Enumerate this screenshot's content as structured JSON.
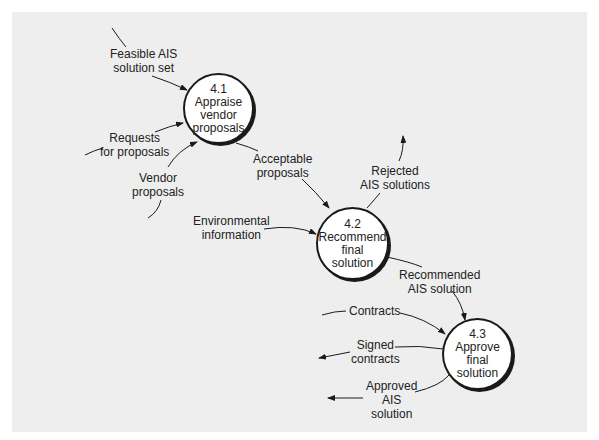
{
  "colors": {
    "panel_bg": "#eeeeee",
    "line": "#1a1a1a",
    "process_fill": "#ffffff"
  },
  "processes": [
    {
      "id": "4.1",
      "lines": [
        "4.1",
        "Appraise",
        "vendor",
        "proposals"
      ]
    },
    {
      "id": "4.2",
      "lines": [
        "4.2",
        "Recommend",
        "final",
        "solution"
      ]
    },
    {
      "id": "4.3",
      "lines": [
        "4.3",
        "Approve",
        "final",
        "solution"
      ]
    }
  ],
  "flows": [
    {
      "name": "feasible-ais-solution-set",
      "lines": [
        "Feasible AIS",
        "solution set"
      ]
    },
    {
      "name": "requests-for-proposals",
      "lines": [
        "Requests",
        "for proposals"
      ]
    },
    {
      "name": "vendor-proposals",
      "lines": [
        "Vendor",
        "proposals"
      ]
    },
    {
      "name": "acceptable-proposals",
      "lines": [
        "Acceptable",
        "proposals"
      ]
    },
    {
      "name": "rejected-ais-solutions",
      "lines": [
        "Rejected",
        "AIS solutions"
      ]
    },
    {
      "name": "environmental-information",
      "lines": [
        "Environmental",
        "information"
      ]
    },
    {
      "name": "recommended-ais-solution",
      "lines": [
        "Recommended",
        "AIS solution"
      ]
    },
    {
      "name": "contracts",
      "lines": [
        "Contracts"
      ]
    },
    {
      "name": "signed-contracts",
      "lines": [
        "Signed",
        "contracts"
      ]
    },
    {
      "name": "approved-ais-solution",
      "lines": [
        "Approved",
        "AIS",
        "solution"
      ]
    }
  ]
}
